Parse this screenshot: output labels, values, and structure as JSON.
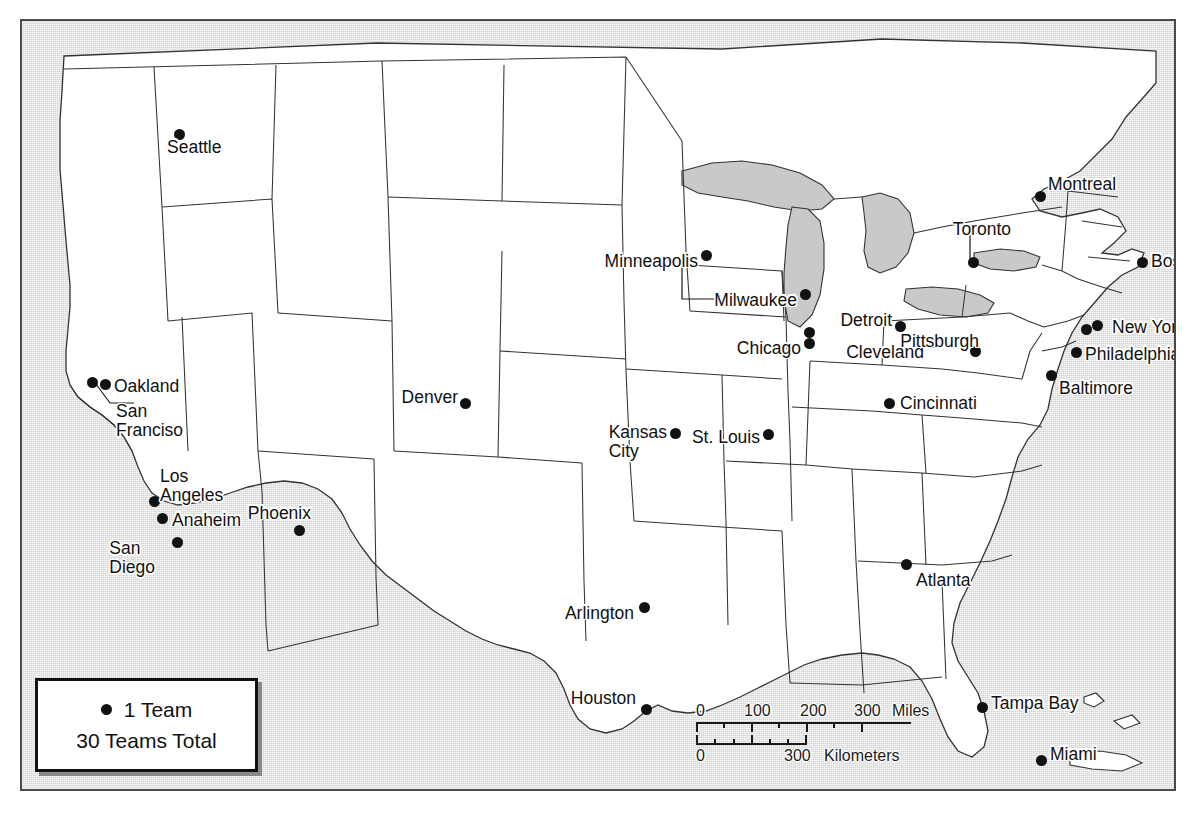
{
  "map": {
    "title": "Major League Baseball Team Locations Map",
    "frame_color": "#4a4a4a",
    "ocean_color": "#d4d4d4",
    "land_color": "#ffffff",
    "lake_color": "#c9c9c9",
    "border_color": "#333333",
    "dot_color": "#111111"
  },
  "legend": {
    "unit_label": "1 Team",
    "total_label": "30 Teams Total",
    "dot_icon": "filled-circle-icon"
  },
  "scalebar": {
    "miles": {
      "labels": [
        "0",
        "100",
        "200",
        "300"
      ],
      "unit": "Miles"
    },
    "kilometers": {
      "labels": [
        "0",
        "300"
      ],
      "unit": "Kilometers"
    }
  },
  "caption": {
    "text": ""
  },
  "cities": [
    {
      "name": "Seattle",
      "label": "Seattle",
      "dot": [
        157,
        113
      ],
      "label_pos": [
        145,
        126
      ],
      "anchor": "right",
      "teams": 1
    },
    {
      "name": "Oakland",
      "label": "Oakland",
      "dot": [
        83,
        363
      ],
      "label_pos": [
        92,
        365
      ],
      "anchor": "right",
      "teams": 1
    },
    {
      "name": "San Francisco",
      "label": "San\nFranciso",
      "dot": [
        70,
        361
      ],
      "label_pos": [
        94,
        400
      ],
      "anchor": "right",
      "teams": 1
    },
    {
      "name": "Los Angeles",
      "label": "Los\nAngeles",
      "dot": [
        132,
        480
      ],
      "label_pos": [
        138,
        465
      ],
      "anchor": "right",
      "teams": 1
    },
    {
      "name": "Anaheim",
      "label": "Anaheim",
      "dot": [
        140,
        497
      ],
      "label_pos": [
        150,
        499
      ],
      "anchor": "right",
      "teams": 1
    },
    {
      "name": "San Diego",
      "label": "San\nDiego",
      "dot": [
        155,
        521
      ],
      "label_pos": [
        133,
        537
      ],
      "anchor": "left",
      "teams": 1
    },
    {
      "name": "Phoenix",
      "label": "Phoenix",
      "dot": [
        277,
        509
      ],
      "label_pos": [
        289,
        492
      ],
      "anchor": "left",
      "teams": 1
    },
    {
      "name": "Denver",
      "label": "Denver",
      "dot": [
        443,
        382
      ],
      "label_pos": [
        436,
        376
      ],
      "anchor": "left",
      "teams": 1
    },
    {
      "name": "Arlington",
      "label": "Arlington",
      "dot": [
        622,
        586
      ],
      "label_pos": [
        612,
        592
      ],
      "anchor": "left",
      "teams": 1
    },
    {
      "name": "Houston",
      "label": "Houston",
      "dot": [
        624,
        688
      ],
      "label_pos": [
        614,
        677
      ],
      "anchor": "left",
      "teams": 1
    },
    {
      "name": "Minneapolis",
      "label": "Minneapolis",
      "dot": [
        684,
        234
      ],
      "label_pos": [
        676,
        240
      ],
      "anchor": "left",
      "teams": 1
    },
    {
      "name": "Milwaukee",
      "label": "Milwaukee",
      "dot": [
        783,
        273
      ],
      "label_pos": [
        775,
        279
      ],
      "anchor": "left",
      "teams": 1
    },
    {
      "name": "Chicago",
      "label": "Chicago",
      "dot": [
        787,
        322
      ],
      "label_pos": [
        779,
        327
      ],
      "anchor": "left",
      "teams": 2
    },
    {
      "name": "Kansas City",
      "label": "Kansas\nCity",
      "dot": [
        653,
        412
      ],
      "label_pos": [
        645,
        421
      ],
      "anchor": "left",
      "teams": 1
    },
    {
      "name": "St. Louis",
      "label": "St. Louis",
      "dot": [
        746,
        413
      ],
      "label_pos": [
        738,
        416
      ],
      "anchor": "left",
      "teams": 1
    },
    {
      "name": "Detroit",
      "label": "Detroit",
      "dot": [
        878,
        305
      ],
      "label_pos": [
        870,
        299
      ],
      "anchor": "left",
      "teams": 1
    },
    {
      "name": "Cleveland",
      "label": "Cleveland",
      "dot": [
        911,
        321
      ],
      "label_pos": [
        902,
        331
      ],
      "anchor": "left",
      "teams": 1
    },
    {
      "name": "Cincinnati",
      "label": "Cincinnati",
      "dot": [
        867,
        382
      ],
      "label_pos": [
        878,
        382
      ],
      "anchor": "right",
      "teams": 1
    },
    {
      "name": "Pittsburgh",
      "label": "Pittsburgh",
      "dot": [
        953,
        330
      ],
      "label_pos": [
        957,
        320
      ],
      "anchor": "left",
      "teams": 1
    },
    {
      "name": "Toronto",
      "label": "Toronto",
      "dot": [
        951,
        241
      ],
      "label_pos": [
        989,
        208
      ],
      "anchor": "left",
      "teams": 1
    },
    {
      "name": "Montreal",
      "label": "Montreal",
      "dot": [
        1018,
        175
      ],
      "label_pos": [
        1026,
        163
      ],
      "anchor": "right",
      "teams": 1
    },
    {
      "name": "Boston",
      "label": "Boston",
      "dot": [
        1120,
        241
      ],
      "label_pos": [
        1129,
        240
      ],
      "anchor": "right",
      "teams": 1
    },
    {
      "name": "New York",
      "label": "New York",
      "dot": [
        1075,
        304
      ],
      "label_pos": [
        1090,
        306
      ],
      "anchor": "right",
      "teams": 2
    },
    {
      "name": "Philadelphia",
      "label": "Philadelphia",
      "dot": [
        1054,
        331
      ],
      "label_pos": [
        1063,
        333
      ],
      "anchor": "right",
      "teams": 1
    },
    {
      "name": "Baltimore",
      "label": "Baltimore",
      "dot": [
        1029,
        354
      ],
      "label_pos": [
        1037,
        367
      ],
      "anchor": "right",
      "teams": 1
    },
    {
      "name": "Atlanta",
      "label": "Atlanta",
      "dot": [
        884,
        543
      ],
      "label_pos": [
        894,
        559
      ],
      "anchor": "right",
      "teams": 1
    },
    {
      "name": "Tampa Bay",
      "label": "Tampa Bay",
      "dot": [
        960,
        686
      ],
      "label_pos": [
        969,
        682
      ],
      "anchor": "right",
      "teams": 1
    },
    {
      "name": "Miami",
      "label": "Miami",
      "dot": [
        1019,
        739
      ],
      "label_pos": [
        1028,
        733
      ],
      "anchor": "right",
      "teams": 1
    }
  ]
}
